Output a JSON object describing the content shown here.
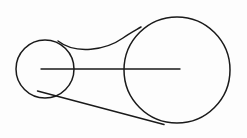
{
  "canvas": {
    "width": 247,
    "height": 138,
    "background_color": "#fdfdfd",
    "stroke_color": "#1a1a1a",
    "title": "Two circles joined by a tangent line and a concave curve"
  },
  "chart_data": {
    "type": "diagram",
    "title": "Two circles joined by a tangent line and a concave curve",
    "xlabel": "",
    "ylabel": "",
    "xlim": [
      0,
      247
    ],
    "ylim": [
      0,
      138
    ],
    "grid": false,
    "legend": "none",
    "shapes": [
      {
        "name": "small-circle",
        "type": "circle",
        "cx": 45,
        "cy": 69,
        "r": 29,
        "stroke_width": 1.5,
        "fill": "none"
      },
      {
        "name": "large-circle",
        "type": "circle",
        "cx": 177,
        "cy": 70,
        "r": 53,
        "stroke_width": 1.5,
        "fill": "none"
      },
      {
        "name": "center-axis-line",
        "type": "line",
        "x1": 41,
        "y1": 69,
        "x2": 180,
        "y2": 69,
        "stroke_width": 1.4
      },
      {
        "name": "upper-concave-curve",
        "type": "path",
        "d": "M 58 41 C 76 55, 106 50, 123 38 C 130 33, 136 30, 141 27",
        "stroke_width": 1.5
      },
      {
        "name": "lower-tangent-line",
        "type": "line",
        "x1": 37.5,
        "y1": 91,
        "x2": 164,
        "y2": 124.5,
        "stroke_width": 1.5
      }
    ]
  }
}
